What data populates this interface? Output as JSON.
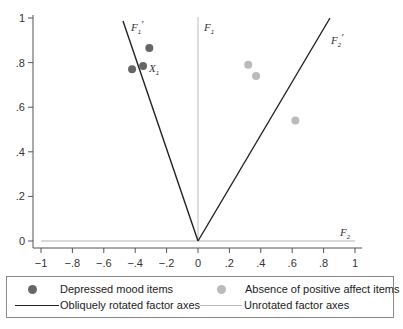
{
  "chart_data": {
    "type": "scatter",
    "title": "",
    "xlabel": "",
    "ylabel": "",
    "xlim": [
      -1,
      1
    ],
    "ylim": [
      0,
      1
    ],
    "x_ticks": [
      "−1",
      "−.8",
      "−.6",
      "−.4",
      "−.2",
      "0",
      ".2",
      ".4",
      ".6",
      ".8",
      "1"
    ],
    "x_tick_values": [
      -1,
      -0.8,
      -0.6,
      -0.4,
      -0.2,
      0,
      0.2,
      0.4,
      0.6,
      0.8,
      1
    ],
    "y_ticks": [
      "0",
      ".2",
      ".4",
      ".6",
      ".8",
      "1"
    ],
    "y_tick_values": [
      0,
      0.2,
      0.4,
      0.6,
      0.8,
      1
    ],
    "grid": false,
    "series": [
      {
        "name": "Depressed mood items",
        "color": "#666666",
        "points": [
          {
            "x": -0.31,
            "y": 0.865
          },
          {
            "x": -0.35,
            "y": 0.785
          },
          {
            "x": -0.42,
            "y": 0.77
          }
        ]
      },
      {
        "name": "Absence of positive affect items",
        "color": "#bbbbbb",
        "points": [
          {
            "x": 0.32,
            "y": 0.79
          },
          {
            "x": 0.37,
            "y": 0.74
          },
          {
            "x": 0.62,
            "y": 0.54
          }
        ]
      }
    ],
    "lines": [
      {
        "name": "Obliquely rotated factor axes",
        "label": "F1'",
        "color": "#222222",
        "from": [
          0,
          0
        ],
        "to": [
          -0.48,
          0.99
        ]
      },
      {
        "name": "Obliquely rotated factor axes",
        "label": "F2'",
        "color": "#222222",
        "from": [
          0,
          0
        ],
        "to": [
          0.84,
          1.0
        ]
      },
      {
        "name": "Unrotated factor axes",
        "label": "F1",
        "color": "#bbbbbb",
        "from": [
          0,
          0
        ],
        "to": [
          0,
          1.0
        ]
      },
      {
        "name": "Unrotated factor axes",
        "label": "F2",
        "color": "#cccccc",
        "from": [
          -1,
          0
        ],
        "to": [
          1,
          0
        ]
      }
    ],
    "annotations": [
      {
        "text": "X1",
        "x": -0.3,
        "y": 0.76
      },
      {
        "text": "F1'",
        "x": -0.4,
        "y": 0.96
      },
      {
        "text": "F2'",
        "x": 0.85,
        "y": 0.9
      },
      {
        "text": "F1",
        "x": 0.05,
        "y": 0.96
      },
      {
        "text": "F2",
        "x": 0.93,
        "y": 0.03
      }
    ],
    "legend_position": "bottom"
  },
  "labels": {
    "F1p": "F",
    "F1p_sub": "1",
    "F1p_prime": "′",
    "F2p": "F",
    "F2p_sub": "2",
    "F2p_prime": "′",
    "F1": "F",
    "F1_sub": "1",
    "F2": "F",
    "F2_sub": "2",
    "X1": "X",
    "X1_sub": "1"
  },
  "legend": {
    "items": [
      {
        "label": "Depressed mood items",
        "type": "dot",
        "color": "#666666"
      },
      {
        "label": "Absence of positive affect items",
        "type": "dot",
        "color": "#bbbbbb"
      },
      {
        "label": "Obliquely rotated factor axes",
        "type": "line",
        "color": "#222222"
      },
      {
        "label": "Unrotated factor axes",
        "type": "line",
        "color": "#bbbbbb"
      }
    ]
  }
}
